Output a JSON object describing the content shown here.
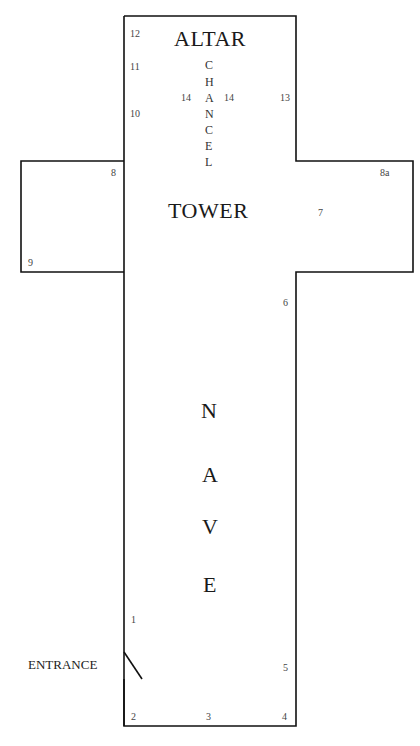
{
  "areas": {
    "altar": "ALTAR",
    "tower": "TOWER",
    "entrance": "ENTRANCE",
    "chancel_letters": [
      "C",
      "H",
      "A",
      "N",
      "C",
      "E",
      "L"
    ],
    "nave_letters": [
      "N",
      "A",
      "V",
      "E"
    ]
  },
  "markers": {
    "m1": "1",
    "m2": "2",
    "m3": "3",
    "m4": "4",
    "m5": "5",
    "m6": "6",
    "m7": "7",
    "m8": "8",
    "m8a": "8a",
    "m9": "9",
    "m10": "10",
    "m11": "11",
    "m12": "12",
    "m13": "13",
    "m14_left": "14",
    "m14_right": "14"
  },
  "colors": {
    "outline": "#111111",
    "background": "#ffffff"
  }
}
